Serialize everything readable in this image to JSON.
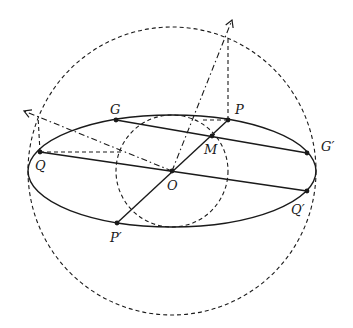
{
  "diagram": {
    "colors": {
      "stroke": "#1a1a1a",
      "background": "#ffffff"
    },
    "center": {
      "label": "O",
      "x": 172,
      "y": 171
    },
    "ellipse": {
      "cx": 172,
      "cy": 171,
      "rx": 144,
      "ry": 56,
      "style": "solid"
    },
    "major_circle": {
      "cx": 172,
      "cy": 171,
      "r": 144,
      "style": "dashed"
    },
    "minor_circle": {
      "cx": 172,
      "cy": 171,
      "r": 56,
      "style": "dashed"
    },
    "points": {
      "G": {
        "label": "G",
        "x": 116,
        "y": 120
      },
      "P": {
        "label": "P",
        "x": 228,
        "y": 120
      },
      "M": {
        "label": "M",
        "x": 212,
        "y": 136
      },
      "G_prime": {
        "label": "G′",
        "x": 307,
        "y": 153
      },
      "Q": {
        "label": "Q",
        "x": 40,
        "y": 152
      },
      "O": {
        "label": "O",
        "x": 172,
        "y": 171
      },
      "Q_prime": {
        "label": "Q′",
        "x": 307,
        "y": 191
      },
      "P_prime": {
        "label": "P′",
        "x": 117,
        "y": 223
      }
    },
    "segments": [
      {
        "name": "chord-GG'",
        "from": "G",
        "to": "G_prime",
        "style": "solid"
      },
      {
        "name": "diameter-QQ'",
        "from": "Q",
        "to": "Q_prime",
        "style": "solid"
      },
      {
        "name": "diameter-PP'",
        "from": "P_prime",
        "to": "P",
        "style": "solid"
      }
    ],
    "rays": [
      {
        "name": "ray-to-P-projection",
        "from": [
          172,
          171
        ],
        "to": [
          232,
          20
        ],
        "style": "dash-dot",
        "arrow": true
      },
      {
        "name": "ray-to-Q-projection",
        "from": [
          172,
          171
        ],
        "to": [
          24,
          111
        ],
        "style": "dash-dot",
        "arrow": true
      }
    ],
    "projections": [
      {
        "name": "P-vertical",
        "from": [
          228,
          120
        ],
        "to": [
          228,
          37
        ],
        "style": "dashed"
      },
      {
        "name": "P-horizontal",
        "from": [
          228,
          120
        ],
        "to": [
          200,
          120
        ],
        "style": "dashed"
      },
      {
        "name": "Q-vertical",
        "from": [
          40,
          152
        ],
        "to": [
          38,
          116
        ],
        "style": "dashed"
      },
      {
        "name": "Q-horizontal",
        "from": [
          40,
          152
        ],
        "to": [
          121,
          152
        ],
        "style": "dashed"
      }
    ]
  }
}
